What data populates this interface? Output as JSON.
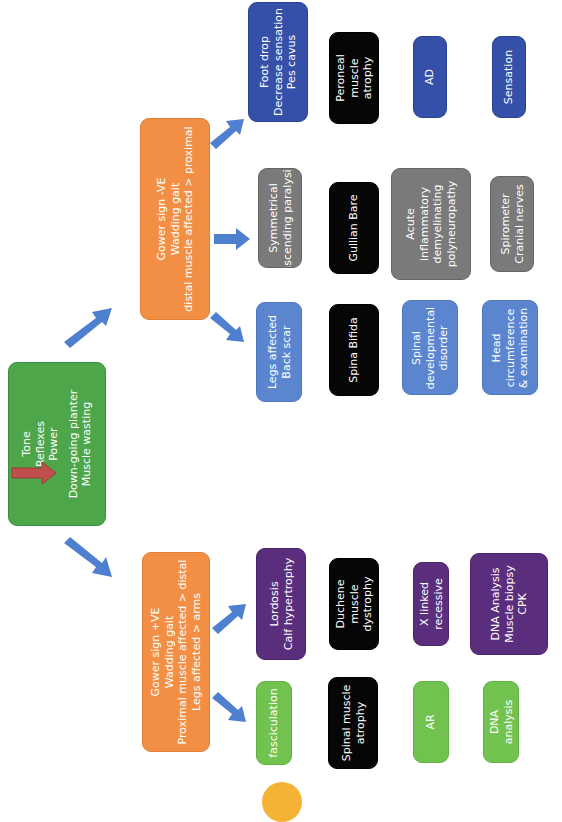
{
  "diagram": {
    "orientation": "rotated-90-ccw",
    "colors": {
      "root": "#4ea64a",
      "branch": "#f28f45",
      "arrow": "#4f7fcf",
      "indicator_arrow": "#c0504d",
      "foot_drop": "#3550a8",
      "blue_light": "#5b86cf",
      "grey": "#7a7a7a",
      "black": "#060606",
      "purple": "#5b2e7d",
      "green_light": "#72c24f",
      "badge": "#f5b335"
    },
    "root": {
      "lines": [
        "Tone",
        "Reflexes",
        "Power"
      ],
      "indicator": "down-arrow",
      "lines2": [
        "Down-going planter",
        "Muscle wasting"
      ]
    },
    "branch_negative": {
      "lines": [
        "Gower sign -VE",
        "Wadding gait",
        "distal muscle affected > proximal"
      ],
      "children": [
        {
          "finding": [
            "Foot drop",
            "Decrease sensation",
            "Pes cavus"
          ],
          "diagnosis": [
            "Peroneal",
            "muscle",
            "atrophy"
          ],
          "detail": [
            "AD"
          ],
          "test": [
            "Sensation"
          ]
        },
        {
          "finding": [
            "Symmetrical",
            "ascending paralysis"
          ],
          "diagnosis": [
            "Gullian Bare"
          ],
          "detail": [
            "Acute",
            "inflammatory",
            "demyelinating",
            "polyneuropathy"
          ],
          "test": [
            "Spirometer",
            "Cranial nerves"
          ]
        },
        {
          "finding": [
            "Legs affected",
            "Back scar"
          ],
          "diagnosis": [
            "Spina Bifida"
          ],
          "detail": [
            "Spinal",
            "developmental",
            "disorder"
          ],
          "test": [
            "Head",
            "circumference",
            "& examination"
          ]
        }
      ]
    },
    "branch_positive": {
      "lines": [
        "Gower sign +VE",
        "Wadding gait",
        "Proximal muscle affected > distal",
        "Legs affected > arms"
      ],
      "children": [
        {
          "finding": [
            "Lordosis",
            "Calf hypertrophy"
          ],
          "diagnosis": [
            "Duchene",
            "muscle",
            "dystrophy"
          ],
          "detail": [
            "X linked",
            "recessive"
          ],
          "test": [
            "DNA Analysis",
            "Muscle biopsy",
            "CPK"
          ]
        },
        {
          "finding": [
            "fasciculation"
          ],
          "diagnosis": [
            "Spinal muscle",
            "atrophy"
          ],
          "detail": [
            "AR"
          ],
          "test": [
            "DNA",
            "analysis"
          ]
        }
      ]
    },
    "page_badge": "22"
  }
}
